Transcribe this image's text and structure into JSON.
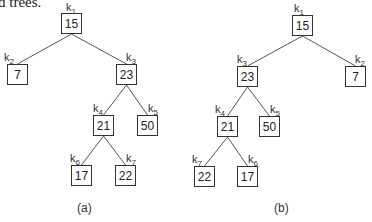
{
  "caption_fragment": "d trees.",
  "trees": [
    {
      "id": "a",
      "label": "(a)",
      "nodes": [
        {
          "key": "k",
          "sub": "1",
          "value": "15",
          "x": 61,
          "y": 13,
          "lx": 66,
          "ly": 2
        },
        {
          "key": "k",
          "sub": "2",
          "value": "7",
          "x": 7,
          "y": 64,
          "lx": 4,
          "ly": 52
        },
        {
          "key": "k",
          "sub": "3",
          "value": "23",
          "x": 116,
          "y": 64,
          "lx": 126,
          "ly": 52
        },
        {
          "key": "k",
          "sub": "4",
          "value": "21",
          "x": 93,
          "y": 115,
          "lx": 93,
          "ly": 103
        },
        {
          "key": "k",
          "sub": "5",
          "value": "50",
          "x": 137,
          "y": 115,
          "lx": 148,
          "ly": 103
        },
        {
          "key": "k",
          "sub": "6",
          "value": "17",
          "x": 71,
          "y": 165,
          "lx": 70,
          "ly": 153
        },
        {
          "key": "k",
          "sub": "7",
          "value": "22",
          "x": 115,
          "y": 165,
          "lx": 126,
          "ly": 153
        }
      ],
      "edges": [
        [
          0,
          1
        ],
        [
          0,
          2
        ],
        [
          2,
          3
        ],
        [
          2,
          4
        ],
        [
          3,
          5
        ],
        [
          3,
          6
        ]
      ]
    },
    {
      "id": "b",
      "label": "(b)",
      "nodes": [
        {
          "key": "k",
          "sub": "1",
          "value": "15",
          "x": 292,
          "y": 15,
          "lx": 294,
          "ly": 3
        },
        {
          "key": "k",
          "sub": "2",
          "value": "7",
          "x": 345,
          "y": 66,
          "lx": 355,
          "ly": 54
        },
        {
          "key": "k",
          "sub": "3",
          "value": "23",
          "x": 237,
          "y": 66,
          "lx": 237,
          "ly": 54
        },
        {
          "key": "k",
          "sub": "4",
          "value": "21",
          "x": 217,
          "y": 116,
          "lx": 215,
          "ly": 104
        },
        {
          "key": "k",
          "sub": "5",
          "value": "50",
          "x": 259,
          "y": 116,
          "lx": 270,
          "ly": 104
        },
        {
          "key": "k",
          "sub": "7",
          "value": "22",
          "x": 194,
          "y": 166,
          "lx": 192,
          "ly": 154
        },
        {
          "key": "k",
          "sub": "6",
          "value": "17",
          "x": 237,
          "y": 166,
          "lx": 248,
          "ly": 154
        }
      ],
      "edges": [
        [
          0,
          2
        ],
        [
          0,
          1
        ],
        [
          2,
          3
        ],
        [
          2,
          4
        ],
        [
          3,
          5
        ],
        [
          3,
          6
        ]
      ]
    }
  ]
}
